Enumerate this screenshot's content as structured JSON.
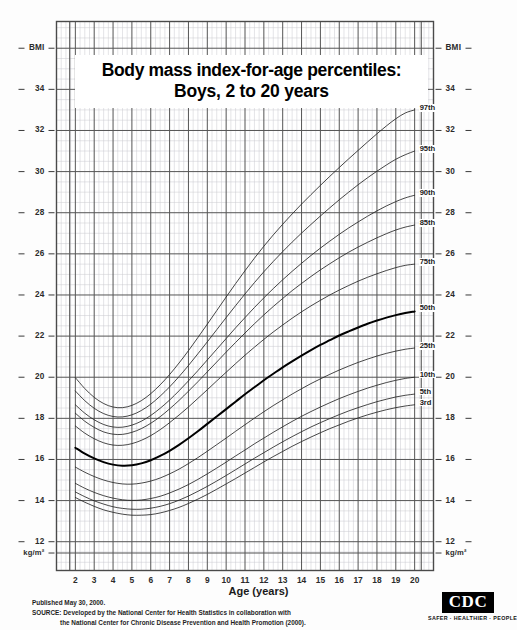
{
  "title": {
    "line1": "Body mass index-for-age percentiles:",
    "line2": "Boys, 2 to 20 years"
  },
  "axes": {
    "y_label_top_left": "BMI",
    "y_label_top_right": "BMI",
    "y_unit_left": "kg/m²",
    "y_unit_right": "kg/m²",
    "x_title": "Age (years)",
    "y_ticks": [
      34,
      32,
      30,
      28,
      26,
      24,
      22,
      20,
      18,
      16,
      14,
      12
    ],
    "x_ticks": [
      2,
      3,
      4,
      5,
      6,
      7,
      8,
      9,
      10,
      11,
      12,
      13,
      14,
      15,
      16,
      17,
      18,
      19,
      20
    ]
  },
  "percentile_labels": [
    "97th",
    "95th",
    "90th",
    "85th",
    "75th",
    "50th",
    "25th",
    "10th",
    "5th",
    "3rd"
  ],
  "footer": {
    "published": "Published May 30, 2000.",
    "source_line1": "SOURCE: Developed by the National Center for Health Statistics in collaboration with",
    "source_line2": "the National Center for Chronic Disease Prevention and Health Promotion (2000)."
  },
  "logo": {
    "mark": "CDC",
    "tagline": "SAFER · HEALTHIER · PEOPLE™"
  },
  "colors": {
    "curve": "#262626",
    "curve_bold": "#000000",
    "grid_major": "#555555",
    "grid_minor": "#c8c8cf",
    "frame": "#4a4a4a",
    "background": "#fdfdfd"
  },
  "chart_data": {
    "type": "line",
    "title": "Body mass index-for-age percentiles: Boys, 2 to 20 years",
    "xlabel": "Age (years)",
    "ylabel": "BMI (kg/m²)",
    "xlim": [
      2,
      20
    ],
    "ylim": [
      12,
      35
    ],
    "grid": true,
    "legend": "inline-right-end-labels",
    "x": [
      2,
      2.5,
      3,
      3.5,
      4,
      4.5,
      5,
      5.5,
      6,
      6.5,
      7,
      7.5,
      8,
      8.5,
      9,
      9.5,
      10,
      10.5,
      11,
      11.5,
      12,
      12.5,
      13,
      13.5,
      14,
      14.5,
      15,
      15.5,
      16,
      16.5,
      17,
      17.5,
      18,
      18.5,
      19,
      19.5,
      20
    ],
    "series": [
      {
        "name": "97th",
        "bold": false,
        "values": [
          19.98,
          19.45,
          19.02,
          18.72,
          18.55,
          18.52,
          18.63,
          18.86,
          19.2,
          19.63,
          20.13,
          20.69,
          21.29,
          21.93,
          22.58,
          23.24,
          23.9,
          24.55,
          25.18,
          25.79,
          26.37,
          26.92,
          27.44,
          27.94,
          28.42,
          28.88,
          29.33,
          29.77,
          30.2,
          30.62,
          31.03,
          31.44,
          31.84,
          32.22,
          32.57,
          32.85,
          33.0
        ]
      },
      {
        "name": "95th",
        "bold": false,
        "values": [
          19.33,
          18.86,
          18.49,
          18.23,
          18.09,
          18.07,
          18.17,
          18.38,
          18.69,
          19.08,
          19.53,
          20.03,
          20.57,
          21.14,
          21.72,
          22.31,
          22.9,
          23.48,
          24.05,
          24.6,
          25.13,
          25.63,
          26.11,
          26.57,
          27.01,
          27.43,
          27.84,
          28.24,
          28.63,
          29.0,
          29.36,
          29.7,
          30.02,
          30.32,
          30.6,
          30.82,
          31.0
        ]
      },
      {
        "name": "90th",
        "bold": false,
        "values": [
          18.66,
          18.25,
          17.93,
          17.7,
          17.58,
          17.57,
          17.67,
          17.86,
          18.14,
          18.49,
          18.89,
          19.34,
          19.82,
          20.32,
          20.84,
          21.36,
          21.88,
          22.4,
          22.9,
          23.39,
          23.86,
          24.31,
          24.74,
          25.15,
          25.54,
          25.92,
          26.28,
          26.62,
          26.95,
          27.26,
          27.55,
          27.83,
          28.09,
          28.33,
          28.54,
          28.72,
          28.85
        ]
      },
      {
        "name": "85th",
        "bold": false,
        "values": [
          18.25,
          17.86,
          17.56,
          17.34,
          17.23,
          17.22,
          17.32,
          17.5,
          17.76,
          18.08,
          18.46,
          18.87,
          19.32,
          19.78,
          20.26,
          20.74,
          21.22,
          21.69,
          22.15,
          22.6,
          23.03,
          23.44,
          23.83,
          24.21,
          24.56,
          24.9,
          25.22,
          25.52,
          25.81,
          26.08,
          26.33,
          26.56,
          26.78,
          26.98,
          27.16,
          27.3,
          27.4
        ]
      },
      {
        "name": "75th",
        "bold": false,
        "values": [
          17.63,
          17.28,
          17.01,
          16.81,
          16.7,
          16.69,
          16.77,
          16.93,
          17.16,
          17.45,
          17.79,
          18.16,
          18.55,
          18.97,
          19.39,
          19.82,
          20.24,
          20.66,
          21.07,
          21.46,
          21.84,
          22.2,
          22.54,
          22.87,
          23.18,
          23.47,
          23.74,
          24.0,
          24.24,
          24.46,
          24.67,
          24.86,
          25.03,
          25.19,
          25.33,
          25.44,
          25.5
        ]
      },
      {
        "name": "50th",
        "bold": true,
        "values": [
          16.57,
          16.28,
          16.05,
          15.87,
          15.75,
          15.7,
          15.72,
          15.81,
          15.96,
          16.17,
          16.42,
          16.71,
          17.03,
          17.37,
          17.73,
          18.09,
          18.45,
          18.81,
          19.17,
          19.51,
          19.85,
          20.17,
          20.48,
          20.77,
          21.05,
          21.32,
          21.57,
          21.8,
          22.03,
          22.23,
          22.42,
          22.6,
          22.76,
          22.9,
          23.02,
          23.12,
          23.2
        ]
      },
      {
        "name": "25th",
        "bold": false,
        "values": [
          15.63,
          15.38,
          15.17,
          15.0,
          14.88,
          14.81,
          14.8,
          14.85,
          14.95,
          15.1,
          15.3,
          15.53,
          15.8,
          16.09,
          16.4,
          16.72,
          17.04,
          17.37,
          17.69,
          18.01,
          18.32,
          18.62,
          18.9,
          19.18,
          19.44,
          19.69,
          19.92,
          20.14,
          20.35,
          20.54,
          20.72,
          20.88,
          21.03,
          21.16,
          21.27,
          21.36,
          21.42
        ]
      },
      {
        "name": "10th",
        "bold": false,
        "values": [
          14.84,
          14.6,
          14.4,
          14.24,
          14.12,
          14.04,
          14.01,
          14.03,
          14.1,
          14.21,
          14.37,
          14.56,
          14.78,
          15.03,
          15.3,
          15.58,
          15.87,
          16.17,
          16.46,
          16.76,
          17.04,
          17.32,
          17.59,
          17.85,
          18.1,
          18.33,
          18.55,
          18.76,
          18.96,
          19.14,
          19.31,
          19.47,
          19.61,
          19.74,
          19.85,
          19.94,
          20.0
        ]
      },
      {
        "name": "5th",
        "bold": false,
        "values": [
          14.42,
          14.19,
          13.99,
          13.83,
          13.7,
          13.62,
          13.58,
          13.58,
          13.63,
          13.72,
          13.85,
          14.02,
          14.22,
          14.45,
          14.69,
          14.95,
          15.22,
          15.5,
          15.78,
          16.06,
          16.33,
          16.6,
          16.86,
          17.11,
          17.35,
          17.58,
          17.79,
          17.99,
          18.18,
          18.36,
          18.52,
          18.67,
          18.81,
          18.93,
          19.04,
          19.12,
          19.18
        ]
      },
      {
        "name": "3rd",
        "bold": false,
        "values": [
          14.15,
          13.92,
          13.72,
          13.55,
          13.43,
          13.34,
          13.29,
          13.29,
          13.32,
          13.4,
          13.52,
          13.67,
          13.86,
          14.07,
          14.3,
          14.55,
          14.81,
          15.07,
          15.34,
          15.61,
          15.88,
          16.14,
          16.39,
          16.64,
          16.87,
          17.09,
          17.3,
          17.5,
          17.68,
          17.86,
          18.02,
          18.17,
          18.3,
          18.42,
          18.52,
          18.6,
          18.66
        ]
      }
    ]
  }
}
